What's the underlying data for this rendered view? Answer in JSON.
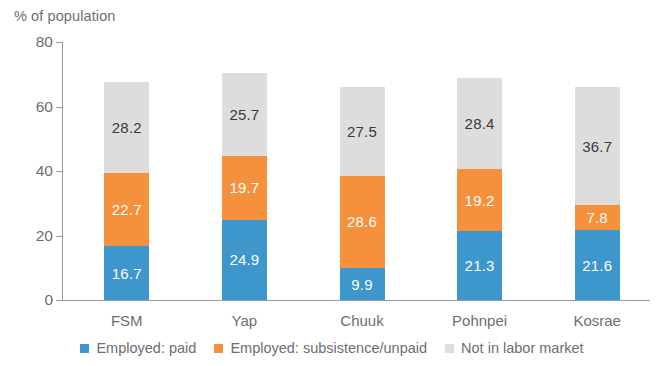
{
  "chart_data": {
    "type": "bar",
    "subtype": "stacked-vertical",
    "title": "",
    "xlabel": "",
    "ylabel": "% of population",
    "ylim": [
      0,
      80
    ],
    "yticks": [
      0,
      20,
      40,
      60,
      80
    ],
    "grid": false,
    "legend_position": "bottom",
    "categories": [
      "FSM",
      "Yap",
      "Chuuk",
      "Pohnpei",
      "Kosrae"
    ],
    "series": [
      {
        "name": "Employed: paid",
        "color": "#3d96cc",
        "label_color": "#ffffff",
        "values": [
          16.7,
          24.9,
          9.9,
          21.3,
          21.6
        ]
      },
      {
        "name": "Employed: subsistence/unpaid",
        "color": "#f5903c",
        "label_color": "#ffffff",
        "values": [
          22.7,
          19.7,
          28.6,
          19.2,
          7.8
        ]
      },
      {
        "name": "Not in labor market",
        "color": "#dddddd",
        "label_color": "#3a3a3a",
        "values": [
          28.2,
          25.7,
          27.5,
          28.4,
          36.7
        ]
      }
    ],
    "totals": [
      67.6,
      70.3,
      66.0,
      68.9,
      66.1
    ]
  },
  "axis": {
    "y_title": "% of population",
    "ticks": [
      "0",
      "20",
      "40",
      "60",
      "80"
    ]
  },
  "legend": {
    "items": [
      {
        "label": "Employed: paid",
        "color": "#3d96cc"
      },
      {
        "label": "Employed: subsistence/unpaid",
        "color": "#f5903c"
      },
      {
        "label": "Not in labor market",
        "color": "#dddddd"
      }
    ]
  }
}
